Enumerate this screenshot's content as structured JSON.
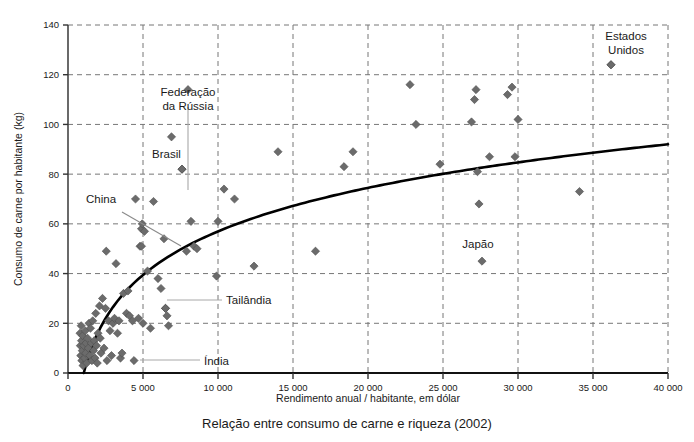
{
  "chart_data": {
    "type": "scatter",
    "title": "Relação entre consumo de carne e riqueza (2002)",
    "xlabel": "Rendimento anual / habitante, em dólar",
    "ylabel": "Consumo de carne por habitante (kg)",
    "xlim": [
      0,
      40000
    ],
    "ylim": [
      0,
      140
    ],
    "xticks": [
      0,
      5000,
      10000,
      15000,
      20000,
      25000,
      30000,
      35000,
      40000
    ],
    "xticklabels": [
      "0",
      "5 000",
      "10 000",
      "15 000",
      "20 000",
      "25 000",
      "30 000",
      "35 000",
      "40 000"
    ],
    "yticks": [
      0,
      20,
      40,
      60,
      80,
      100,
      120,
      140
    ],
    "yticklabels": [
      "0",
      "20",
      "40",
      "60",
      "80",
      "100",
      "120",
      "140"
    ],
    "grid": "dashed both axes at major ticks",
    "legend": "none",
    "marker": "diamond",
    "marker_color": "#6b6b6b",
    "trend_color": "#000000",
    "trend_note": "logarithmic best-fit curve rising steeply from ~1000 USD then flattening toward ~92 kg at 40 000 USD",
    "annotations": [
      {
        "label": "Estados Unidos",
        "x": 36200,
        "y": 124
      },
      {
        "label": "Federação da Rússia",
        "x": 8000,
        "y": 114
      },
      {
        "label": "Brasil",
        "x": 7600,
        "y": 82
      },
      {
        "label": "China",
        "x": 4900,
        "y": 51
      },
      {
        "label": "Tailândia",
        "x": 6500,
        "y": 26
      },
      {
        "label": "Índia",
        "x": 4400,
        "y": 5
      }
    ],
    "points": [
      [
        800,
        16
      ],
      [
        820,
        11
      ],
      [
        850,
        7
      ],
      [
        880,
        19
      ],
      [
        900,
        13
      ],
      [
        920,
        5
      ],
      [
        950,
        9
      ],
      [
        980,
        15
      ],
      [
        1000,
        3
      ],
      [
        1050,
        11
      ],
      [
        1100,
        6
      ],
      [
        1150,
        17
      ],
      [
        1180,
        8
      ],
      [
        1200,
        12
      ],
      [
        1250,
        4
      ],
      [
        1300,
        14
      ],
      [
        1350,
        10
      ],
      [
        1400,
        20
      ],
      [
        1450,
        7
      ],
      [
        1500,
        18
      ],
      [
        1550,
        12
      ],
      [
        1600,
        5
      ],
      [
        1650,
        21
      ],
      [
        1700,
        9
      ],
      [
        1750,
        13
      ],
      [
        1800,
        6
      ],
      [
        1850,
        24
      ],
      [
        1900,
        11
      ],
      [
        1950,
        4
      ],
      [
        2000,
        16
      ],
      [
        2100,
        27
      ],
      [
        2150,
        14
      ],
      [
        2200,
        8
      ],
      [
        2300,
        30
      ],
      [
        2400,
        10
      ],
      [
        2500,
        26
      ],
      [
        2550,
        49
      ],
      [
        2600,
        5
      ],
      [
        2700,
        21
      ],
      [
        2800,
        17
      ],
      [
        2900,
        7
      ],
      [
        3000,
        20
      ],
      [
        3100,
        22
      ],
      [
        3200,
        44
      ],
      [
        3300,
        16
      ],
      [
        3400,
        21
      ],
      [
        3500,
        6
      ],
      [
        3600,
        8
      ],
      [
        3700,
        32
      ],
      [
        3900,
        24
      ],
      [
        4000,
        33
      ],
      [
        4100,
        23
      ],
      [
        4300,
        21
      ],
      [
        4500,
        70
      ],
      [
        4700,
        22
      ],
      [
        4800,
        51
      ],
      [
        4900,
        58
      ],
      [
        4950,
        60
      ],
      [
        5000,
        20
      ],
      [
        5100,
        57
      ],
      [
        5300,
        41
      ],
      [
        5500,
        18
      ],
      [
        5700,
        69
      ],
      [
        6000,
        38
      ],
      [
        6200,
        34
      ],
      [
        6400,
        54
      ],
      [
        6500,
        26
      ],
      [
        6600,
        23
      ],
      [
        6700,
        19
      ],
      [
        6900,
        95
      ],
      [
        7600,
        82
      ],
      [
        7900,
        49
      ],
      [
        8200,
        61
      ],
      [
        8400,
        51
      ],
      [
        8600,
        50
      ],
      [
        9900,
        39
      ],
      [
        10000,
        61
      ],
      [
        10400,
        74
      ],
      [
        11100,
        70
      ],
      [
        12400,
        43
      ],
      [
        14000,
        89
      ],
      [
        16500,
        49
      ],
      [
        18400,
        83
      ],
      [
        19000,
        89
      ],
      [
        22800,
        116
      ],
      [
        23200,
        100
      ],
      [
        24800,
        84
      ],
      [
        26900,
        101
      ],
      [
        27100,
        110
      ],
      [
        27200,
        114
      ],
      [
        27300,
        81
      ],
      [
        27400,
        68
      ],
      [
        27600,
        45
      ],
      [
        28100,
        87
      ],
      [
        29300,
        112
      ],
      [
        29600,
        115
      ],
      [
        29800,
        87
      ],
      [
        30000,
        102
      ],
      [
        34100,
        73
      ],
      [
        36200,
        124
      ]
    ]
  },
  "figure": {
    "caption": "Relação entre consumo de carne e riqueza (2002)",
    "xaxis_title": "Rendimento anual / habitante, em dólar",
    "yaxis_title": "Consumo de carne por habitante (kg)"
  }
}
